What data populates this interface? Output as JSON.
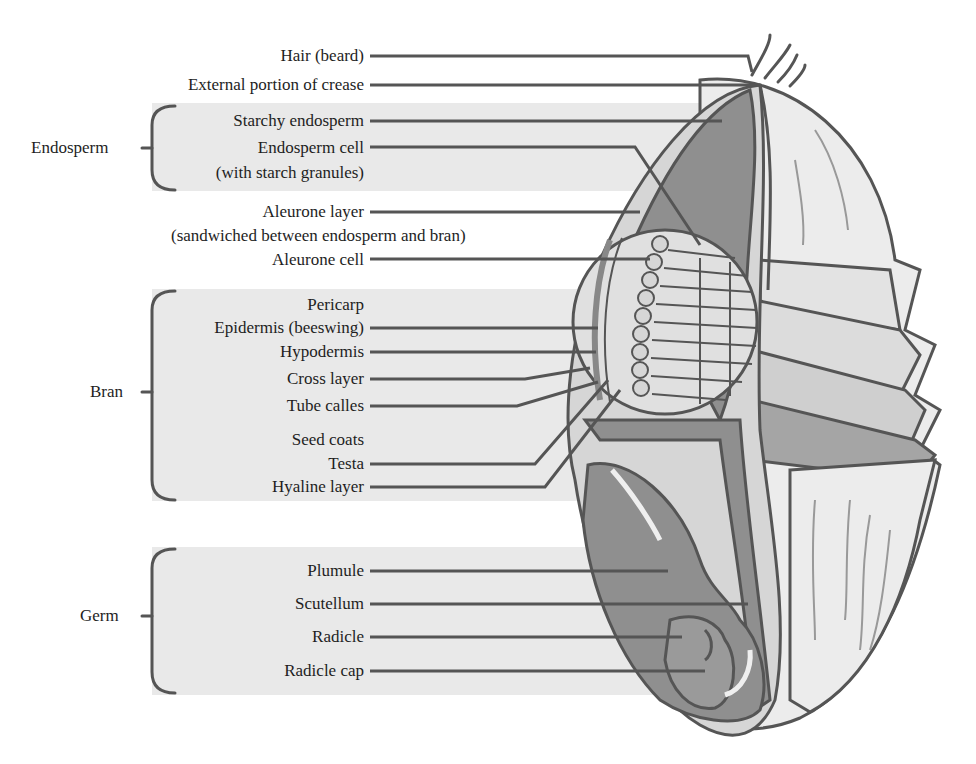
{
  "groups": {
    "endosperm": {
      "label": "Endosperm"
    },
    "bran": {
      "label": "Bran"
    },
    "germ": {
      "label": "Germ"
    }
  },
  "labels": {
    "hair": "Hair (beard)",
    "crease": "External portion of crease",
    "starchy_endosperm": "Starchy endosperm",
    "endosperm_cell_1": "Endosperm cell",
    "endosperm_cell_2": "(with starch granules)",
    "aleurone_layer_1": "Aleurone layer",
    "aleurone_layer_2": "(sandwiched between endosperm and bran)",
    "aleurone_cell": "Aleurone cell",
    "pericarp": "Pericarp",
    "epidermis": "Epidermis (beeswing)",
    "hypodermis": "Hypodermis",
    "cross_layer": "Cross layer",
    "tube_cells": "Tube calles",
    "seed_coats": "Seed coats",
    "testa": "Testa",
    "hyaline_layer": "Hyaline layer",
    "plumule": "Plumule",
    "scutellum": "Scutellum",
    "radicle": "Radicle",
    "radicle_cap": "Radicle cap"
  },
  "colors": {
    "panel": "#e9e9e9",
    "line": "#555555",
    "dark_fill": "#8f8f8f",
    "mid_fill": "#b4b4b4",
    "light_fill": "#d6d6d6",
    "pale_fill": "#ececec"
  }
}
